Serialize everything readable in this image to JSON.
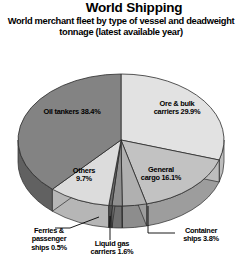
{
  "header": {
    "title": "World Shipping",
    "subtitle": "World merchant fleet by type of vessel and deadweight tonnage (latest available year)"
  },
  "chart_data": {
    "type": "pie",
    "title": "World Shipping",
    "subtitle": "World merchant fleet by type of vessel and deadweight tonnage (latest available year)",
    "units": "percent of deadweight tonnage",
    "legend": "none (direct labels)",
    "grid": false,
    "three_d": true,
    "start_angle_deg": 0,
    "direction": "clockwise",
    "categories": [
      "Ore & bulk carriers",
      "General cargo",
      "Container ships",
      "Liquid gas carriers",
      "Ferries & passenger ships",
      "Others",
      "Oil tankers"
    ],
    "values": [
      29.9,
      16.1,
      3.8,
      1.6,
      0.5,
      9.7,
      38.4
    ],
    "slices": [
      {
        "label": "Ore & bulk carriers",
        "value": 29.9,
        "text": "Ore & bulk carriers 29.9%",
        "color": "#e2e2e2",
        "side_color": "#bdbdbd",
        "leader": false
      },
      {
        "label": "General cargo",
        "value": 16.1,
        "text": "General cargo 16.1%",
        "color": "#c2c2c2",
        "side_color": "#9d9d9d",
        "leader": false
      },
      {
        "label": "Container ships",
        "value": 3.8,
        "text": "Container ships 3.8%",
        "color": "#b0b0b0",
        "side_color": "#8d8d8d",
        "leader": true
      },
      {
        "label": "Liquid gas carriers",
        "value": 1.6,
        "text": "Liquid gas carriers 1.6%",
        "color": "#8f8f8f",
        "side_color": "#6f6f6f",
        "leader": true
      },
      {
        "label": "Ferries & passenger ships",
        "value": 0.5,
        "text": "Ferries & passenger ships 0.5%",
        "color": "#6a6a6a",
        "side_color": "#4f4f4f",
        "leader": true
      },
      {
        "label": "Others",
        "value": 9.7,
        "text": "Others 9.7%",
        "color": "#dcdcdc",
        "side_color": "#b6b6b6",
        "leader": false
      },
      {
        "label": "Oil tankers",
        "value": 38.4,
        "text": "Oil tankers 38.4%",
        "color": "#838383",
        "side_color": "#616161",
        "leader": false
      }
    ]
  },
  "labels": {
    "oil_tankers": "Oil tankers 38.4%",
    "ore_bulk_line1": "Ore & bulk",
    "ore_bulk_line2": "carriers 29.9%",
    "general_line1": "General",
    "general_line2": "cargo 16.1%",
    "others_line1": "Others",
    "others_line2": "9.7%",
    "ferries_line1": "Ferries &",
    "ferries_line2": "passenger",
    "ferries_line3": "ships 0.5%",
    "liquid_line1": "Liquid gas",
    "liquid_line2": "carriers 1.6%",
    "container_line1": "Container",
    "container_line2": "ships 3.8%"
  }
}
